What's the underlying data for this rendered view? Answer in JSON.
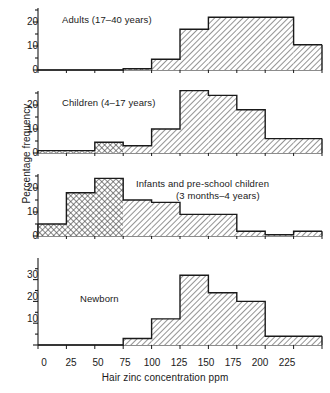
{
  "figure": {
    "ylabel": "Percentage frequency",
    "xlabel": "Hair zinc concentration ppm"
  },
  "panels": [
    {
      "title": "Adults (17–40 years)",
      "ytick_labels": [
        "0",
        "10",
        "20"
      ]
    },
    {
      "title": "Children (4–17 years)",
      "ytick_labels": [
        "0",
        "10",
        "20"
      ]
    },
    {
      "title_line1": "Infants and pre-school children",
      "title_line2": "(3 months–4 years)",
      "ytick_labels": [
        "0",
        "10",
        "20"
      ]
    },
    {
      "title": "Newborn",
      "ytick_labels": [
        "0",
        "10",
        "20",
        "30"
      ]
    }
  ],
  "xtick_labels": [
    "0",
    "25",
    "50",
    "75",
    "100",
    "125",
    "150",
    "175",
    "200",
    "225"
  ],
  "chart_data": {
    "type": "bar",
    "title": "",
    "xlabel": "Hair zinc concentration ppm",
    "ylabel": "Percentage frequency",
    "xlim": [
      0,
      250
    ],
    "bin_width": 25,
    "grid": false,
    "legend": false,
    "panel_layout": "4 stacked histogram panels sharing one x-axis",
    "series": [
      {
        "name": "Adults (17–40 years)",
        "ylim": [
          0,
          24
        ],
        "yticks": [
          0,
          10,
          20
        ],
        "bin_edges": [
          0,
          25,
          50,
          75,
          100,
          125,
          150,
          175,
          200,
          225,
          250
        ],
        "values": [
          0,
          0,
          0,
          0.5,
          4.5,
          17,
          22,
          22,
          22,
          10.5
        ],
        "hatch_by_bin": [
          "none",
          "none",
          "none",
          "dots",
          "diagonal",
          "diagonal",
          "diagonal",
          "diagonal",
          "diagonal",
          "diagonal"
        ]
      },
      {
        "name": "Children (4–17 years)",
        "ylim": [
          0,
          28
        ],
        "yticks": [
          0,
          10,
          20
        ],
        "bin_edges": [
          0,
          25,
          50,
          75,
          100,
          125,
          150,
          175,
          200,
          225,
          250
        ],
        "values": [
          1,
          1,
          4.5,
          3,
          10,
          26,
          24,
          18,
          6,
          6
        ],
        "hatch_by_bin": [
          "dots",
          "dots",
          "dots",
          "diagonal",
          "diagonal",
          "diagonal",
          "diagonal",
          "diagonal",
          "diagonal",
          "diagonal"
        ]
      },
      {
        "name": "Infants and pre-school children (3 months–4 years)",
        "ylim": [
          0,
          26
        ],
        "yticks": [
          0,
          10,
          20
        ],
        "bin_edges": [
          0,
          25,
          50,
          75,
          100,
          125,
          150,
          175,
          200,
          225,
          250
        ],
        "values": [
          5,
          18,
          24,
          15,
          14,
          9,
          9,
          2,
          0.5,
          2
        ],
        "hatch_by_bin": [
          "dots",
          "dots",
          "dots",
          "diagonal",
          "diagonal",
          "diagonal",
          "diagonal",
          "diagonal",
          "diagonal",
          "diagonal"
        ]
      },
      {
        "name": "Newborn",
        "ylim": [
          0,
          35
        ],
        "yticks": [
          0,
          10,
          20,
          30
        ],
        "bin_edges": [
          0,
          25,
          50,
          75,
          100,
          125,
          150,
          175,
          200,
          225,
          250
        ],
        "values": [
          0,
          0,
          0,
          3,
          12,
          32,
          24,
          20,
          4,
          4
        ],
        "hatch_by_bin": [
          "none",
          "none",
          "none",
          "diagonal",
          "diagonal",
          "diagonal",
          "diagonal",
          "diagonal",
          "diagonal",
          "diagonal"
        ]
      }
    ]
  }
}
